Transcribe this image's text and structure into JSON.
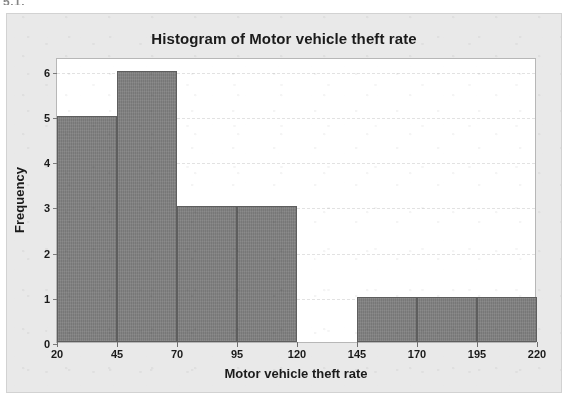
{
  "page_fragment": "5.1.",
  "chart_data": {
    "type": "bar",
    "title": "Histogram of Motor vehicle theft rate",
    "xlabel": "Motor vehicle theft rate",
    "ylabel": "Frequency",
    "bin_width": 25,
    "bin_edges": [
      20,
      45,
      70,
      95,
      120,
      145,
      170,
      195,
      220
    ],
    "categories": [
      "20-45",
      "45-70",
      "70-95",
      "95-120",
      "120-145",
      "145-170",
      "170-195",
      "195-220"
    ],
    "values": [
      5,
      6,
      3,
      3,
      0,
      1,
      1,
      1
    ],
    "xlim": [
      20,
      220
    ],
    "ylim": [
      0,
      6.3
    ],
    "x_ticks": [
      "20",
      "45",
      "70",
      "95",
      "120",
      "145",
      "170",
      "195",
      "220"
    ],
    "y_ticks": [
      "0",
      "1",
      "2",
      "3",
      "4",
      "5",
      "6"
    ],
    "grid": true,
    "legend": null,
    "colors": {
      "bar_fill": "#808080",
      "bar_edge": "#5e5e5e",
      "plot_background": "#ffffff",
      "figure_background": "#e9e9e9",
      "gridline": "#e2e2e2",
      "text": "#1b1b1b",
      "frame": "#b7b7b7"
    }
  }
}
